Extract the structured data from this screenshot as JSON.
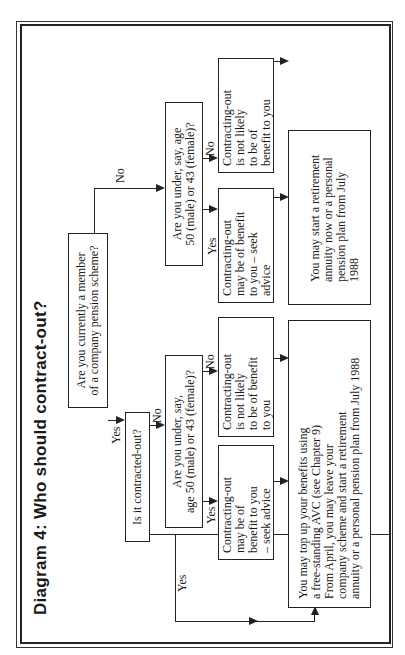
{
  "diagram": {
    "title": "Diagram 4:  Who should contract-out?",
    "q_member": {
      "line1": "Are you currently a member",
      "line2": "of a company pension scheme?"
    },
    "q_contracted": "Is it contracted-out?",
    "q_age_member": {
      "line1": "Are you under, say,",
      "line2": "age 50 (male) or 43 (female)?"
    },
    "q_age_nonmember": {
      "line1": "Are you under, say, age",
      "line2": "50 (male) or 43 (female)?"
    },
    "labels": {
      "yes": "Yes",
      "no": "No"
    },
    "member_benefit": {
      "l1": "Contracting-out",
      "l2": "may be of",
      "l3": "benefit to you",
      "l4": "– seek advice"
    },
    "member_not_likely": {
      "l1": "Contracting-out",
      "l2": "is not likely",
      "l3": "to be of benefit",
      "l4": "to you"
    },
    "nonmember_benefit": {
      "l1": "Contracting-out",
      "l2": "may be of benefit",
      "l3": "to you – seek",
      "l4": "advice"
    },
    "nonmember_not_likely": {
      "l1": "Contracting-out",
      "l2": "is not likely",
      "l3": "to be of",
      "l4": "benefit to you"
    },
    "member_outcome": {
      "l1": "You may top up your benefits using",
      "l2": "a free-standing AVC (see Chapter 9)",
      "l3": "From April, you may leave your",
      "l4": "company scheme and start a retirement",
      "l5": "annuity or a personal pension plan from July 1988"
    },
    "nonmember_outcome": {
      "l1": "You may start a retirement",
      "l2": "annuity now or a personal",
      "l3": "pension plan from July",
      "l4": "1988"
    }
  }
}
